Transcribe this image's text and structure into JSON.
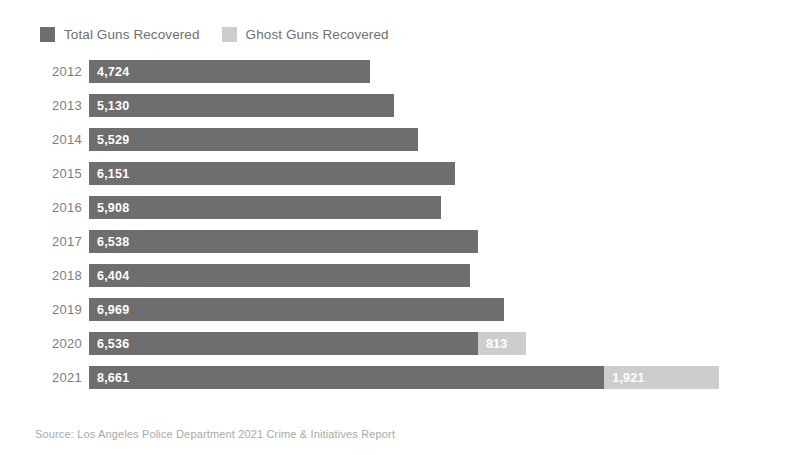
{
  "legend": {
    "position": "top-left",
    "entries": [
      {
        "label": "Total Guns Recovered",
        "color": "#6e6e6e",
        "swatch_icon": "legend-swatch-icon"
      },
      {
        "label": "Ghost Guns Recovered",
        "color": "#cdcdcd",
        "swatch_icon": "legend-swatch-icon"
      }
    ]
  },
  "source": {
    "text": "Source: Los Angeles Police Department 2021 Crime & Initiatives Report"
  },
  "chart_data": {
    "type": "bar",
    "orientation": "horizontal",
    "title": "",
    "subtitle": "",
    "xlabel": "",
    "ylabel": "",
    "grid": false,
    "legend_position": "top-left",
    "xlim": [
      0,
      11200
    ],
    "categories": [
      "2012",
      "2013",
      "2014",
      "2015",
      "2016",
      "2017",
      "2018",
      "2019",
      "2020",
      "2021"
    ],
    "series": [
      {
        "name": "Total Guns Recovered",
        "color": "#6e6e6e",
        "values": [
          4724,
          5130,
          5529,
          6151,
          5908,
          6538,
          6404,
          6969,
          6536,
          8661
        ],
        "labels": [
          "4,724",
          "5,130",
          "5,529",
          "6,151",
          "5,908",
          "6,538",
          "6,404",
          "6,969",
          "6,536",
          "8,661"
        ]
      },
      {
        "name": "Ghost Guns Recovered",
        "color": "#cdcdcd",
        "values": [
          0,
          0,
          0,
          0,
          0,
          0,
          0,
          0,
          813,
          1921
        ],
        "labels": [
          "",
          "",
          "",
          "",
          "",
          "",
          "",
          "",
          "813",
          "1,921"
        ]
      }
    ],
    "rows": [
      {
        "year": "2012",
        "total": 4724,
        "total_label": "4,724",
        "ghost": 0,
        "ghost_label": ""
      },
      {
        "year": "2013",
        "total": 5130,
        "total_label": "5,130",
        "ghost": 0,
        "ghost_label": ""
      },
      {
        "year": "2014",
        "total": 5529,
        "total_label": "5,529",
        "ghost": 0,
        "ghost_label": ""
      },
      {
        "year": "2015",
        "total": 6151,
        "total_label": "6,151",
        "ghost": 0,
        "ghost_label": ""
      },
      {
        "year": "2016",
        "total": 5908,
        "total_label": "5,908",
        "ghost": 0,
        "ghost_label": ""
      },
      {
        "year": "2017",
        "total": 6538,
        "total_label": "6,538",
        "ghost": 0,
        "ghost_label": ""
      },
      {
        "year": "2018",
        "total": 6404,
        "total_label": "6,404",
        "ghost": 0,
        "ghost_label": ""
      },
      {
        "year": "2019",
        "total": 6969,
        "total_label": "6,969",
        "ghost": 0,
        "ghost_label": ""
      },
      {
        "year": "2020",
        "total": 6536,
        "total_label": "6,536",
        "ghost": 813,
        "ghost_label": "813"
      },
      {
        "year": "2021",
        "total": 8661,
        "total_label": "8,661",
        "ghost": 1921,
        "ghost_label": "1,921"
      }
    ]
  }
}
